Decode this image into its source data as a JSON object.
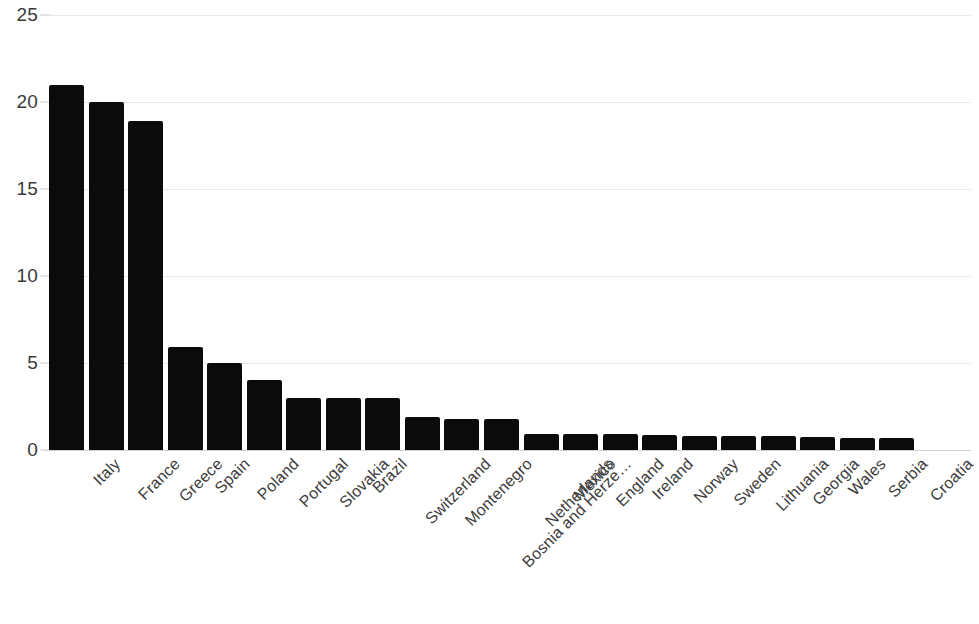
{
  "chart_data": {
    "type": "bar",
    "title": "",
    "subtitle": "",
    "xlabel": "",
    "ylabel": "",
    "ylim": [
      0,
      25
    ],
    "yticks": [
      0,
      5,
      10,
      15,
      20,
      25
    ],
    "ytick_labels": [
      "0",
      "5",
      "10",
      "15",
      "20",
      "25"
    ],
    "grid": true,
    "legend": "none",
    "bar_color": "#0b0b0b",
    "grid_color": "#e9e9e9",
    "background_color": "#ffffff",
    "axis_text_color": "#3d3d3d",
    "categories": [
      "Italy",
      "France",
      "Greece",
      "Spain",
      "Poland",
      "Portugal",
      "Slovakia",
      "Brazil",
      "Switzerland",
      "Montenegro",
      "Bosnia and Herze…",
      "Netherlands",
      "Mexico",
      "England",
      "Ireland",
      "Norway",
      "Sweden",
      "Lithuania",
      "Georgia",
      "Wales",
      "Serbia",
      "Croatia"
    ],
    "values": [
      21,
      20,
      18.9,
      5.9,
      5,
      4,
      3,
      3,
      3,
      1.9,
      1.8,
      1.8,
      0.9,
      0.9,
      0.9,
      0.85,
      0.8,
      0.8,
      0.8,
      0.75,
      0.7,
      0.7
    ]
  }
}
